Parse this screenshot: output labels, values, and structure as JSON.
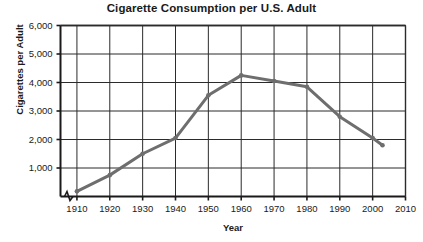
{
  "chart_data": {
    "type": "line",
    "title": "Cigarette Consumption per U.S. Adult",
    "xlabel": "Year",
    "ylabel": "Cigarettes per Adult",
    "xlim": [
      1905,
      2010
    ],
    "ylim": [
      0,
      6000
    ],
    "grid": true,
    "legend": "none",
    "axis_break_x": true,
    "x_ticks": [
      1910,
      1920,
      1930,
      1940,
      1950,
      1960,
      1970,
      1980,
      1990,
      2000,
      2010
    ],
    "x_tick_labels": [
      "1910",
      "1920",
      "1930",
      "1940",
      "1950",
      "1960",
      "1970",
      "1980",
      "1990",
      "2000",
      "2010"
    ],
    "y_ticks": [
      1000,
      2000,
      3000,
      4000,
      5000,
      6000
    ],
    "y_tick_labels": [
      "1,000",
      "2,000",
      "3,000",
      "4,000",
      "5,000",
      "6,000"
    ],
    "series": [
      {
        "name": "Cigarettes per Adult",
        "color": "#6e6e6e",
        "marker": "circle",
        "x": [
          1910,
          1920,
          1930,
          1940,
          1950,
          1960,
          1970,
          1980,
          1990,
          2000,
          2003
        ],
        "values": [
          180,
          750,
          1500,
          2050,
          3550,
          4250,
          4050,
          3850,
          2800,
          2050,
          1800
        ]
      }
    ]
  },
  "colors": {
    "line": "#6e6e6e",
    "grid": "#2b2b2b",
    "axis": "#1a1a1a",
    "background": "#ffffff",
    "text": "#1a1a1a"
  }
}
